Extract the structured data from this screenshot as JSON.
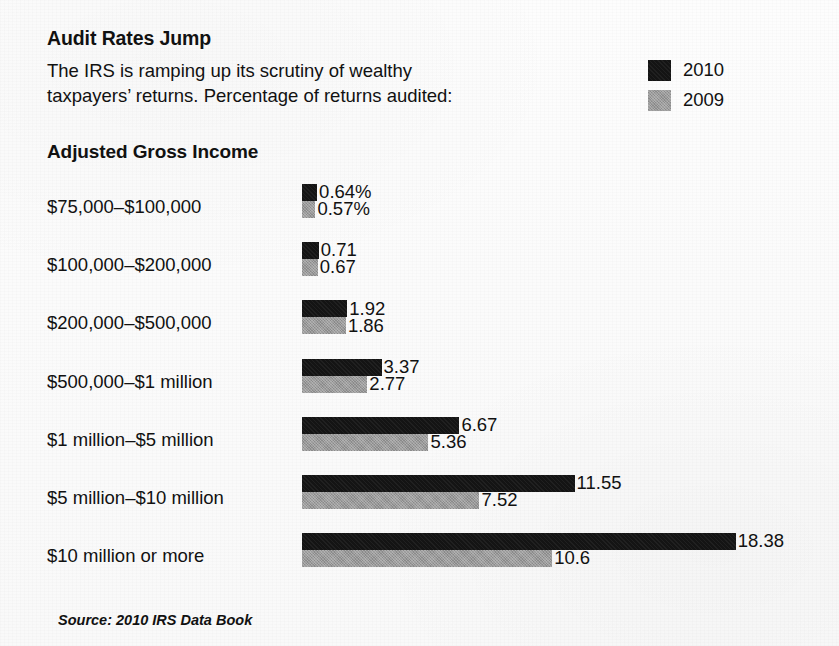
{
  "header": {
    "headline": "Audit Rates Jump",
    "deck_line1": "The IRS is ramping up its scrutiny of wealthy",
    "deck_line2": "taxpayers’ returns. Percentage of returns audited:"
  },
  "legend": {
    "items": [
      {
        "label": "2010",
        "color": "#141414"
      },
      {
        "label": "2009",
        "color": "#9a9a9a"
      }
    ]
  },
  "section": {
    "title": "Adjusted Gross Income"
  },
  "source": {
    "text": "Source: 2010 IRS Data Book"
  },
  "chart_data": {
    "type": "bar",
    "orientation": "horizontal",
    "title": "Audit Rates Jump",
    "subtitle": "The IRS is ramping up its scrutiny of wealthy taxpayers’ returns. Percentage of returns audited:",
    "xlabel": "",
    "ylabel": "Adjusted Gross Income",
    "xlim": [
      0,
      18.38
    ],
    "grid": false,
    "legend_position": "top-right",
    "value_suffix_first_group": "%",
    "source": "Source: 2010 IRS Data Book",
    "categories": [
      "$75,000–$100,000",
      "$100,000–$200,000",
      "$200,000–$500,000",
      "$500,000–$1 million",
      "$1 million–$5 million",
      "$5 million–$10 million",
      "$10 million or more"
    ],
    "series": [
      {
        "name": "2010",
        "color": "#141414",
        "values": [
          0.64,
          0.71,
          1.92,
          3.37,
          6.67,
          11.55,
          18.38
        ],
        "labels": [
          "0.64%",
          "0.71",
          "1.92",
          "3.37",
          "6.67",
          "11.55",
          "18.38"
        ]
      },
      {
        "name": "2009",
        "color": "#9a9a9a",
        "values": [
          0.57,
          0.67,
          1.86,
          2.77,
          5.36,
          7.52,
          10.6
        ],
        "labels": [
          "0.57%",
          "0.67",
          "1.86",
          "2.77",
          "5.36",
          "7.52",
          "10.6"
        ]
      }
    ]
  }
}
